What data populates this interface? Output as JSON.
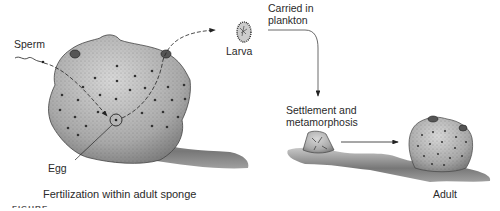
{
  "diagram": {
    "title_fragment": "FIGURE",
    "labels": {
      "sperm": "Sperm",
      "egg": "Egg",
      "larva": "Larva",
      "carried": "Carried in",
      "carried2": "plankton",
      "settlement": "Settlement and",
      "settlement2": "metamorphosis",
      "adult": "Adult",
      "fertilization": "Fertilization within adult sponge"
    },
    "stages": [
      "Fertilization within adult sponge",
      "Larva",
      "Carried in plankton",
      "Settlement and metamorphosis",
      "Adult"
    ],
    "colors": {
      "sponge": "#b8b8b8",
      "substrate": "#8a8a8a",
      "ink": "#222222",
      "background": "#ffffff"
    }
  }
}
